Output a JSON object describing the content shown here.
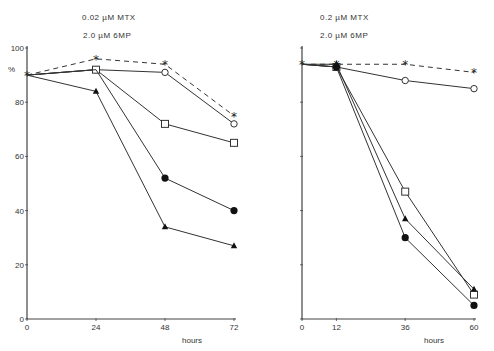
{
  "chart_data": [
    {
      "type": "line",
      "annotations": [
        "0.02 µM MTX",
        "2.0 µM 6MP"
      ],
      "xlabel": "hours",
      "ylabel": "%",
      "x": [
        0,
        24,
        48,
        72
      ],
      "xticks": [
        "0",
        "24",
        "48",
        "72"
      ],
      "yticks": [
        "0",
        "20",
        "40",
        "60",
        "80",
        "100"
      ],
      "ylim": [
        0,
        100
      ],
      "xlim": [
        0,
        72
      ],
      "grid": false,
      "series": [
        {
          "name": "asterisk (dashed)",
          "marker": "asterisk",
          "dashed": true,
          "values": [
            90,
            96,
            94,
            75
          ]
        },
        {
          "name": "open circle",
          "marker": "open-circle",
          "dashed": false,
          "values": [
            90,
            92,
            91,
            72
          ]
        },
        {
          "name": "open square",
          "marker": "open-square",
          "dashed": false,
          "values": [
            90,
            92,
            72,
            65
          ]
        },
        {
          "name": "filled circle",
          "marker": "filled-circle",
          "dashed": false,
          "values": [
            90,
            92,
            52,
            40
          ]
        },
        {
          "name": "filled triangle",
          "marker": "filled-triangle",
          "dashed": false,
          "values": [
            90,
            84,
            34,
            27
          ]
        }
      ]
    },
    {
      "type": "line",
      "annotations": [
        "0.2 µM MTX",
        "2.0 µM 6MP"
      ],
      "xlabel": "hours",
      "ylabel": "",
      "x": [
        0,
        12,
        36,
        60
      ],
      "xticks": [
        "0",
        "12",
        "36",
        "60"
      ],
      "yticks": [],
      "ylim": [
        0,
        100
      ],
      "xlim": [
        0,
        60
      ],
      "grid": false,
      "series": [
        {
          "name": "asterisk (dashed)",
          "marker": "asterisk",
          "dashed": true,
          "values": [
            94,
            94,
            94,
            91
          ]
        },
        {
          "name": "open circle",
          "marker": "open-circle",
          "dashed": false,
          "values": [
            94,
            93,
            88,
            85
          ]
        },
        {
          "name": "open square",
          "marker": "open-square",
          "dashed": false,
          "values": [
            94,
            93,
            47,
            9
          ]
        },
        {
          "name": "filled triangle",
          "marker": "filled-triangle",
          "dashed": false,
          "values": [
            94,
            94,
            37,
            11
          ]
        },
        {
          "name": "filled circle",
          "marker": "filled-circle",
          "dashed": false,
          "values": [
            94,
            93,
            30,
            5
          ]
        }
      ]
    }
  ],
  "panels": [
    {
      "ann1": "0.02 µM MTX",
      "ann2": "2.0 µM 6MP",
      "xlabel": "hours",
      "ylabel": "%"
    },
    {
      "ann1": "0.2 µM MTX",
      "ann2": "2.0 µM 6MP",
      "xlabel": "hours"
    }
  ]
}
